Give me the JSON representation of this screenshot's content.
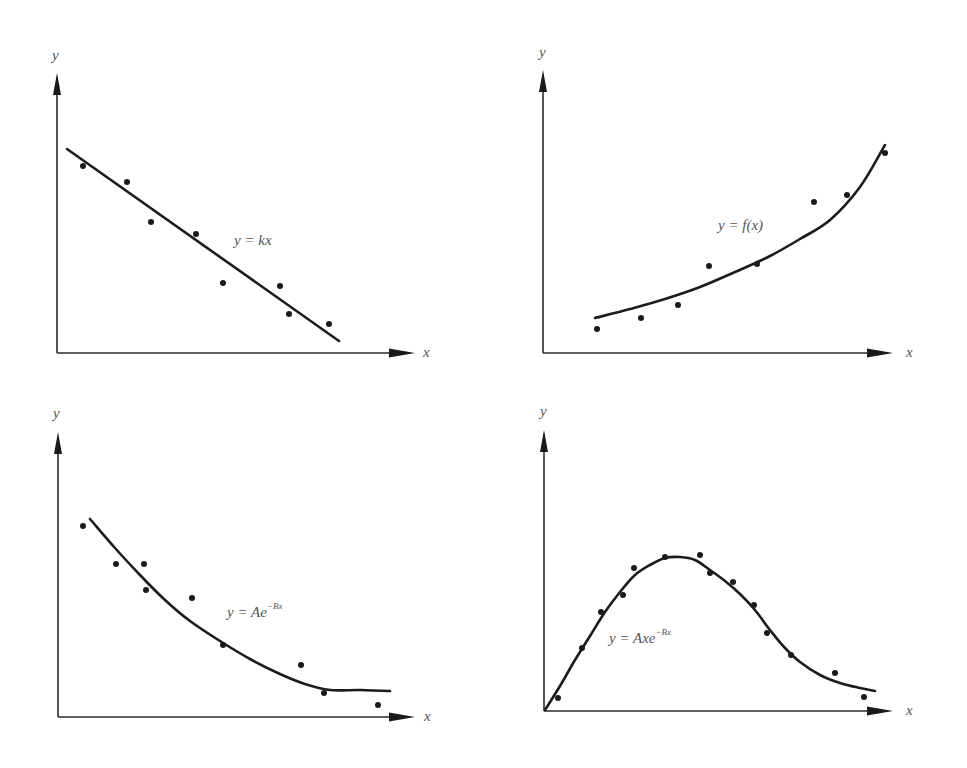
{
  "figure": {
    "panels": [
      {
        "id": "linear",
        "x_label": "x",
        "y_label": "y",
        "formula": {
          "base": "y = kx",
          "sup": ""
        }
      },
      {
        "id": "general",
        "x_label": "x",
        "y_label": "y",
        "formula": {
          "base": "y = f(x)",
          "sup": ""
        }
      },
      {
        "id": "exp-decay",
        "x_label": "x",
        "y_label": "y",
        "formula": {
          "base": "y = Ae",
          "sup": "−Bx"
        }
      },
      {
        "id": "x-exp-decay",
        "x_label": "x",
        "y_label": "y",
        "formula": {
          "base": "y = Axe",
          "sup": "−Bx"
        }
      }
    ]
  },
  "chart_data": [
    {
      "type": "scatter",
      "title": "",
      "xlabel": "x",
      "ylabel": "y",
      "fit_label": "y = kx",
      "grid": false,
      "legend": "none",
      "units": "screen px",
      "axes": {
        "origin": [
          57,
          353
        ],
        "x_end": [
          415,
          353
        ],
        "y_end": [
          57,
          73
        ]
      },
      "label_pos": {
        "x": [
          423,
          357
        ],
        "y": [
          52,
          60
        ],
        "formula": [
          234,
          245
        ]
      },
      "points": [
        [
          83,
          166
        ],
        [
          127,
          182
        ],
        [
          151,
          222
        ],
        [
          196,
          234
        ],
        [
          223,
          283
        ],
        [
          280,
          286
        ],
        [
          289,
          314
        ],
        [
          329,
          324
        ]
      ],
      "fit": {
        "kind": "line",
        "path": [
          [
            67,
            149
          ],
          [
            339,
            341
          ]
        ]
      }
    },
    {
      "type": "scatter",
      "title": "",
      "xlabel": "x",
      "ylabel": "y",
      "fit_label": "y = f(x)",
      "grid": false,
      "legend": "none",
      "units": "screen px",
      "axes": {
        "origin": [
          543,
          353
        ],
        "x_end": [
          893,
          353
        ],
        "y_end": [
          543,
          70
        ]
      },
      "label_pos": {
        "x": [
          906,
          357
        ],
        "y": [
          539,
          57
        ],
        "formula": [
          718,
          230
        ]
      },
      "points": [
        [
          597,
          329
        ],
        [
          641,
          318
        ],
        [
          678,
          305
        ],
        [
          709,
          266
        ],
        [
          757,
          264
        ],
        [
          814,
          202
        ],
        [
          847,
          195
        ],
        [
          885,
          153
        ]
      ],
      "fit": {
        "kind": "curve",
        "path": [
          [
            595,
            318
          ],
          [
            630,
            309
          ],
          [
            665,
            299
          ],
          [
            700,
            287
          ],
          [
            735,
            272
          ],
          [
            770,
            256
          ],
          [
            800,
            239
          ],
          [
            830,
            220
          ],
          [
            860,
            187
          ],
          [
            885,
            145
          ]
        ]
      }
    },
    {
      "type": "scatter",
      "title": "",
      "xlabel": "x",
      "ylabel": "y",
      "fit_label": "y = Ae^(-Bx)",
      "grid": false,
      "legend": "none",
      "units": "screen px",
      "axes": {
        "origin": [
          58,
          717
        ],
        "x_end": [
          415,
          717
        ],
        "y_end": [
          58,
          432
        ]
      },
      "label_pos": {
        "x": [
          424,
          721
        ],
        "y": [
          53,
          418
        ],
        "formula": [
          227,
          617
        ]
      },
      "points": [
        [
          83,
          526
        ],
        [
          116,
          564
        ],
        [
          144,
          564
        ],
        [
          146,
          590
        ],
        [
          192,
          598
        ],
        [
          223,
          645
        ],
        [
          301,
          665
        ],
        [
          324,
          693
        ],
        [
          378,
          705
        ]
      ],
      "fit": {
        "kind": "curve",
        "path": [
          [
            90,
            519
          ],
          [
            115,
            548
          ],
          [
            140,
            575
          ],
          [
            165,
            600
          ],
          [
            190,
            621
          ],
          [
            220,
            641
          ],
          [
            250,
            659
          ],
          [
            280,
            674
          ],
          [
            305,
            684
          ],
          [
            330,
            690
          ],
          [
            360,
            690
          ],
          [
            390,
            691
          ]
        ]
      }
    },
    {
      "type": "scatter",
      "title": "",
      "xlabel": "x",
      "ylabel": "y",
      "fit_label": "y = Axe^(-Bx)",
      "grid": false,
      "legend": "none",
      "units": "screen px",
      "axes": {
        "origin": [
          544,
          711
        ],
        "x_end": [
          893,
          711
        ],
        "y_end": [
          544,
          430
        ]
      },
      "label_pos": {
        "x": [
          906,
          715
        ],
        "y": [
          540,
          416
        ],
        "formula": [
          609,
          643
        ]
      },
      "points": [
        [
          558,
          698
        ],
        [
          582,
          648
        ],
        [
          601,
          612
        ],
        [
          623,
          595
        ],
        [
          634,
          568
        ],
        [
          665,
          557
        ],
        [
          700,
          555
        ],
        [
          710,
          573
        ],
        [
          733,
          582
        ],
        [
          754,
          605
        ],
        [
          767,
          633
        ],
        [
          791,
          655
        ],
        [
          835,
          673
        ],
        [
          864,
          697
        ]
      ],
      "fit": {
        "kind": "curve",
        "path": [
          [
            545,
            710
          ],
          [
            560,
            686
          ],
          [
            575,
            660
          ],
          [
            590,
            636
          ],
          [
            605,
            612
          ],
          [
            620,
            592
          ],
          [
            635,
            575
          ],
          [
            650,
            565
          ],
          [
            665,
            558
          ],
          [
            680,
            557
          ],
          [
            695,
            560
          ],
          [
            710,
            570
          ],
          [
            725,
            581
          ],
          [
            740,
            594
          ],
          [
            755,
            610
          ],
          [
            770,
            630
          ],
          [
            785,
            648
          ],
          [
            800,
            662
          ],
          [
            820,
            675
          ],
          [
            840,
            683
          ],
          [
            860,
            688
          ],
          [
            875,
            691
          ]
        ]
      }
    }
  ]
}
